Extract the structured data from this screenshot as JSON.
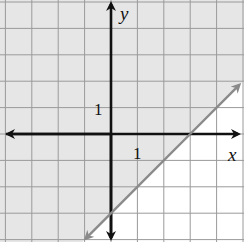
{
  "chart_data": {
    "type": "inequality-graph",
    "title": "",
    "xlabel": "x",
    "ylabel": "y",
    "tick_labels": {
      "x": "1",
      "y": "1"
    },
    "boundary_line": {
      "equation": "y = x - 3",
      "slope": 1,
      "intercept": -3,
      "style": "solid",
      "color": "#8a8a8a"
    },
    "inequality": "y >= x - 3",
    "shaded_region": "above-left of line",
    "xlim": [
      -4.2,
      5.0
    ],
    "ylim": [
      -4.0,
      5.1
    ],
    "grid": true,
    "points_on_line": [
      [
        3,
        0
      ],
      [
        0,
        -3
      ]
    ],
    "colors": {
      "shade": "#e6e6e6",
      "grid": "#9a9a9a",
      "axis": "#111111",
      "line": "#8a8a8a",
      "background": "#ffffff"
    }
  },
  "labels": {
    "x_axis": "x",
    "y_axis": "y",
    "x_tick": "1",
    "y_tick": "1"
  }
}
